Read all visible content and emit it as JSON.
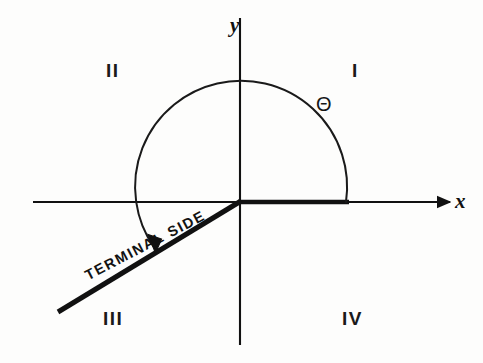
{
  "figure": {
    "background_color": "#fdfdfc",
    "ink_color": "#111111"
  },
  "axes": {
    "x_label": "x",
    "y_label": "y",
    "origin": {
      "x": 240,
      "y": 202
    },
    "x_axis": {
      "start_x": 33,
      "end_x": 452,
      "y": 202,
      "arrow": "right"
    },
    "y_axis": {
      "x": 240,
      "start_y": 18,
      "end_y": 345,
      "arrow": "none"
    }
  },
  "quadrants": [
    {
      "name": "quadrant-1",
      "label": "I"
    },
    {
      "name": "quadrant-2",
      "label": "II"
    },
    {
      "name": "quadrant-3",
      "label": "III"
    },
    {
      "name": "quadrant-4",
      "label": "IV"
    }
  ],
  "angle": {
    "symbol": "Θ",
    "arc_radius": 106,
    "arc_start_degrees": 0,
    "arc_end_degrees": 208,
    "direction": "counterclockwise",
    "arrow_at": "terminal"
  },
  "rays": {
    "initial_side": {
      "label": "",
      "from": {
        "x": 240,
        "y": 202
      },
      "to": {
        "x": 348,
        "y": 202
      }
    },
    "terminal_side": {
      "label": "TERMINAL SIDE",
      "from": {
        "x": 240,
        "y": 202
      },
      "to": {
        "x": 58,
        "y": 312
      },
      "angle_degrees": 208
    }
  }
}
